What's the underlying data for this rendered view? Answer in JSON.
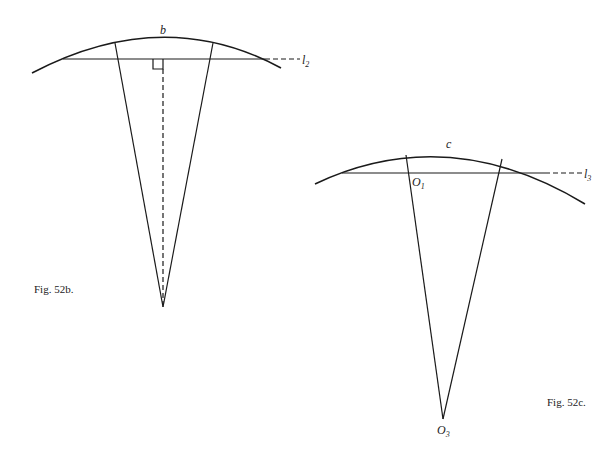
{
  "figures": [
    {
      "id": "fig-52b",
      "caption": "Fig. 52b.",
      "arc_label": "b",
      "line_label": "l",
      "line_label_sub": "2",
      "elements": {
        "arc": {
          "start": [
            32,
            73
          ],
          "peak": [
            163,
            39
          ],
          "end": [
            280,
            68
          ]
        },
        "chord_line": {
          "x1": 63,
          "x2": 265,
          "y": 59,
          "dashed_to_x": 300
        },
        "left_radial": {
          "top": [
            115,
            43
          ],
          "apex": [
            163,
            307
          ]
        },
        "right_radial": {
          "top": [
            213,
            43
          ],
          "apex": [
            163,
            307
          ]
        },
        "perpendicular_dashed": {
          "x": 163,
          "y1": 59,
          "y2": 307
        },
        "right_angle_marker": {
          "x": 153,
          "y": 59,
          "size": 10
        }
      }
    },
    {
      "id": "fig-52c",
      "caption": "Fig. 52c.",
      "arc_label": "c",
      "line_label": "l",
      "line_label_sub": "3",
      "point_upper_label": "O",
      "point_upper_sub": "1",
      "apex_label": "O",
      "apex_sub": "3",
      "elements": {
        "arc": {
          "start": [
            315,
            184
          ],
          "peak": [
            448,
            152
          ],
          "end": [
            585,
            204
          ]
        },
        "chord_line": {
          "x1": 342,
          "x2": 545,
          "y": 173,
          "dashed_to_x": 582
        },
        "left_radial": {
          "top": [
            406,
            155
          ],
          "apex": [
            443,
            419
          ]
        },
        "right_radial": {
          "top": [
            502,
            159
          ],
          "apex": [
            443,
            419
          ]
        }
      }
    }
  ]
}
